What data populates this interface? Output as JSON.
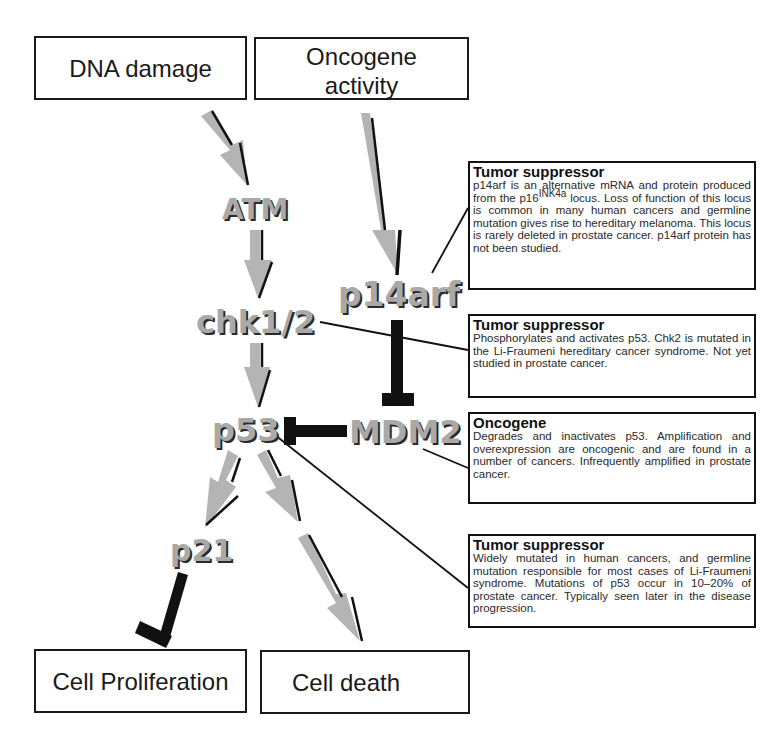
{
  "diagram": {
    "inputs": [
      {
        "id": "dna-damage",
        "label": "DNA damage"
      },
      {
        "id": "oncogene-activity",
        "label_line1": "Oncogene",
        "label_line2": "activity"
      }
    ],
    "nodes": {
      "atm": "ATM",
      "chk": "chk1/2",
      "p14arf": "p14arf",
      "p53": "p53",
      "mdm2": "MDM2",
      "p21": "p21"
    },
    "outputs": [
      {
        "id": "cell-proliferation",
        "label": "Cell Proliferation"
      },
      {
        "id": "cell-death",
        "label": "Cell death"
      }
    ],
    "annotations": [
      {
        "target": "p14arf",
        "title": "Tumor suppressor",
        "text_before_sup": "p14arf is an alternative mRNA and protein produced from the p16",
        "sup": "INK4a",
        "text_after_sup": " locus.  Loss of function of this locus is common in many human cancers and germline mutation gives rise to hereditary melanoma.  This locus is rarely deleted in prostate cancer. p14arf protein has not been studied."
      },
      {
        "target": "chk1/2",
        "title": "Tumor suppressor",
        "text": "Phosphorylates and activates p53. Chk2 is mutated in the Li-Fraumeni hereditary cancer syndrome.  Not yet studied in prostate cancer."
      },
      {
        "target": "MDM2",
        "title": "Oncogene",
        "text": "Degrades and inactivates p53.  Amplification and overexpression are oncogenic and are found in a number of cancers.  Infrequently amplified in prostate cancer."
      },
      {
        "target": "p53",
        "title": "Tumor suppressor",
        "text": "Widely mutated in human cancers, and germline mutation responsible for most cases of Li-Fraumeni syndrome.  Mutations of p53 occur in 10–20% of prostate cancer.  Typically seen later in the disease progression."
      }
    ],
    "edges": [
      {
        "from": "DNA damage",
        "to": "ATM",
        "type": "activation"
      },
      {
        "from": "ATM",
        "to": "chk1/2",
        "type": "activation"
      },
      {
        "from": "chk1/2",
        "to": "p53",
        "type": "activation"
      },
      {
        "from": "Oncogene activity",
        "to": "p14arf",
        "type": "activation"
      },
      {
        "from": "p14arf",
        "to": "MDM2",
        "type": "inhibition"
      },
      {
        "from": "MDM2",
        "to": "p53",
        "type": "inhibition"
      },
      {
        "from": "p53",
        "to": "p21",
        "type": "activation"
      },
      {
        "from": "p53",
        "to": "Cell death",
        "type": "activation"
      },
      {
        "from": "p21",
        "to": "Cell Proliferation",
        "type": "inhibition"
      }
    ],
    "colors": {
      "arrow_fill": "#b4b4b4",
      "arrow_shadow": "#111111",
      "inhibitor": "#111111",
      "node_text": "#a9a9a9"
    }
  }
}
